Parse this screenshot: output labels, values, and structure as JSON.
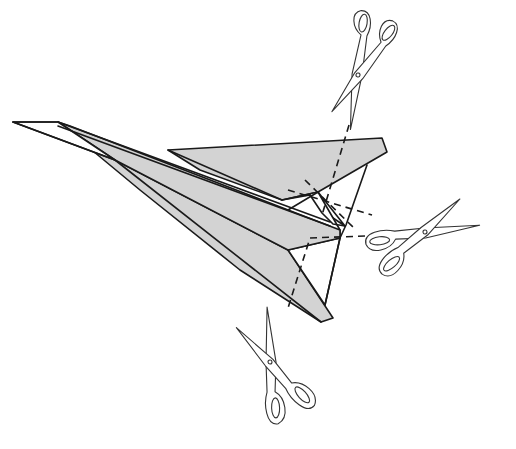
{
  "figure": {
    "colors": {
      "paper": "#d3d3d3",
      "ink": "#1a1a1a",
      "background": "#ffffff"
    },
    "elements": {
      "airplane": "paper-airplane",
      "cut_lines": "dashed-cut-lines",
      "scissors": [
        "scissors-top",
        "scissors-right",
        "scissors-bottom"
      ]
    }
  }
}
